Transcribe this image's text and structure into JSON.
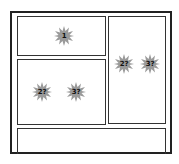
{
  "layout": {
    "panels": [
      {
        "id": "panel-1",
        "markers": [
          {
            "label": "1"
          }
        ]
      },
      {
        "id": "panel-2-left",
        "markers": [
          {
            "label": "2?"
          },
          {
            "label": "3?"
          }
        ]
      },
      {
        "id": "panel-right-column",
        "markers": [
          {
            "label": "2?"
          },
          {
            "label": "3?"
          }
        ]
      },
      {
        "id": "panel-bottom",
        "markers": []
      }
    ]
  },
  "colors": {
    "border": "#222222",
    "star_fill": "#9a9a9a",
    "background": "#ffffff"
  }
}
